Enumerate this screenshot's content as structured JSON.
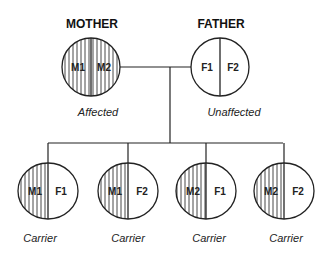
{
  "parents": {
    "mother": {
      "title": "MOTHER",
      "alleles": [
        "M1",
        "M2"
      ],
      "status": "Affected"
    },
    "father": {
      "title": "FATHER",
      "alleles": [
        "F1",
        "F2"
      ],
      "status": "Unaffected"
    }
  },
  "children": [
    {
      "alleles": [
        "M1",
        "F1"
      ],
      "status": "Carrier"
    },
    {
      "alleles": [
        "M1",
        "F2"
      ],
      "status": "Carrier"
    },
    {
      "alleles": [
        "M2",
        "F1"
      ],
      "status": "Carrier"
    },
    {
      "alleles": [
        "M2",
        "F2"
      ],
      "status": "Carrier"
    }
  ],
  "colors": {
    "stroke": "#222222",
    "background": "#ffffff"
  }
}
